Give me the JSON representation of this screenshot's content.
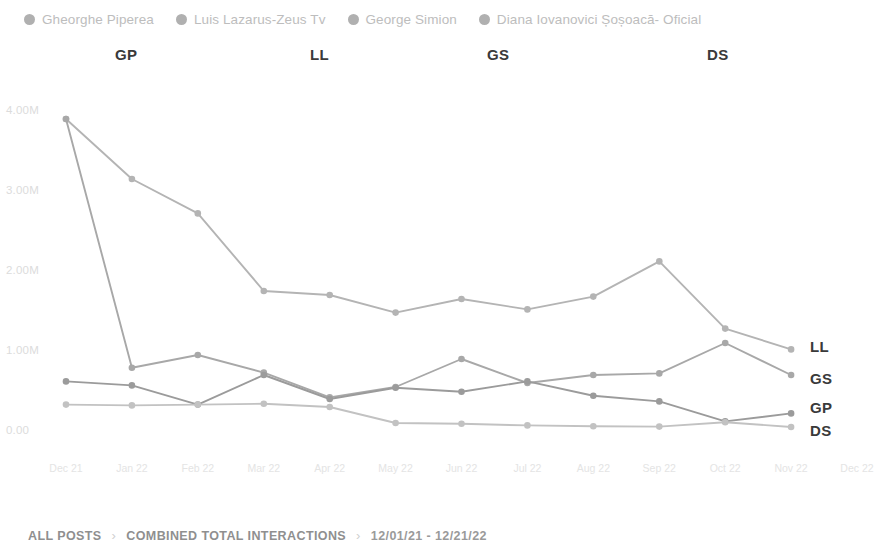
{
  "legend": {
    "items": [
      {
        "label": "Gheorghe Piperea",
        "color": "#b0b0b0",
        "code": "GP"
      },
      {
        "label": "Luis Lazarus-Zeus Tv",
        "color": "#b5b5b5",
        "code": "LL"
      },
      {
        "label": "George Simion",
        "color": "#ababab",
        "code": "GS"
      },
      {
        "label": "Diana Iovanovici Șoșoacă- Oficial",
        "color": "#b0b0b0",
        "code": "DS"
      }
    ]
  },
  "annotations": {
    "top": [
      {
        "text": "GP",
        "x": 115
      },
      {
        "text": "LL",
        "x": 310
      },
      {
        "text": "GS",
        "x": 487
      },
      {
        "text": "DS",
        "x": 707
      }
    ],
    "right": [
      {
        "text": "LL",
        "x": 810,
        "y": 338
      },
      {
        "text": "GS",
        "x": 810,
        "y": 370
      },
      {
        "text": "GP",
        "x": 810,
        "y": 399
      },
      {
        "text": "DS",
        "x": 810,
        "y": 422
      }
    ]
  },
  "footer": {
    "crumb1": "ALL POSTS",
    "sep1": "›",
    "crumb2": "COMBINED TOTAL INTERACTIONS",
    "sep2": "›",
    "date_range": "12/01/21 - 12/21/22"
  },
  "chart_data": {
    "type": "line",
    "title": "",
    "xlabel": "",
    "ylabel": "",
    "grid": false,
    "legend_position": "top",
    "ylim": [
      0,
      4000000
    ],
    "ytick_values": [
      4000000,
      3000000,
      2000000,
      1000000,
      0
    ],
    "ytick_labels": [
      "4.00M",
      "3.00M",
      "2.00M",
      "1.00M",
      "0.00"
    ],
    "categories": [
      "Dec 21",
      "Jan 22",
      "Feb 22",
      "Mar 22",
      "Apr 22",
      "May 22",
      "Jun 22",
      "Jul 22",
      "Aug 22",
      "Sep 22",
      "Oct 22",
      "Nov 22",
      "Dec 22"
    ],
    "series": [
      {
        "name": "Luis Lazarus-Zeus Tv",
        "code": "LL",
        "color": "#b4b4b4",
        "values": [
          3900000,
          3150000,
          2720000,
          1750000,
          1700000,
          1480000,
          1650000,
          1520000,
          1680000,
          2120000,
          1280000,
          1020000,
          null
        ]
      },
      {
        "name": "George Simion",
        "code": "GS",
        "color": "#a8a8a8",
        "values": [
          3900000,
          790000,
          950000,
          730000,
          420000,
          550000,
          900000,
          600000,
          700000,
          720000,
          1100000,
          700000,
          null
        ]
      },
      {
        "name": "Gheorghe Piperea",
        "code": "GP",
        "color": "#9b9b9b",
        "values": [
          620000,
          570000,
          330000,
          700000,
          400000,
          540000,
          490000,
          620000,
          440000,
          370000,
          120000,
          220000,
          null
        ]
      },
      {
        "name": "Diana Iovanovici Șoșoacă- Oficial",
        "code": "DS",
        "color": "#c2c2c2",
        "values": [
          330000,
          320000,
          330000,
          340000,
          300000,
          100000,
          90000,
          70000,
          60000,
          55000,
          110000,
          50000,
          null
        ]
      }
    ]
  }
}
